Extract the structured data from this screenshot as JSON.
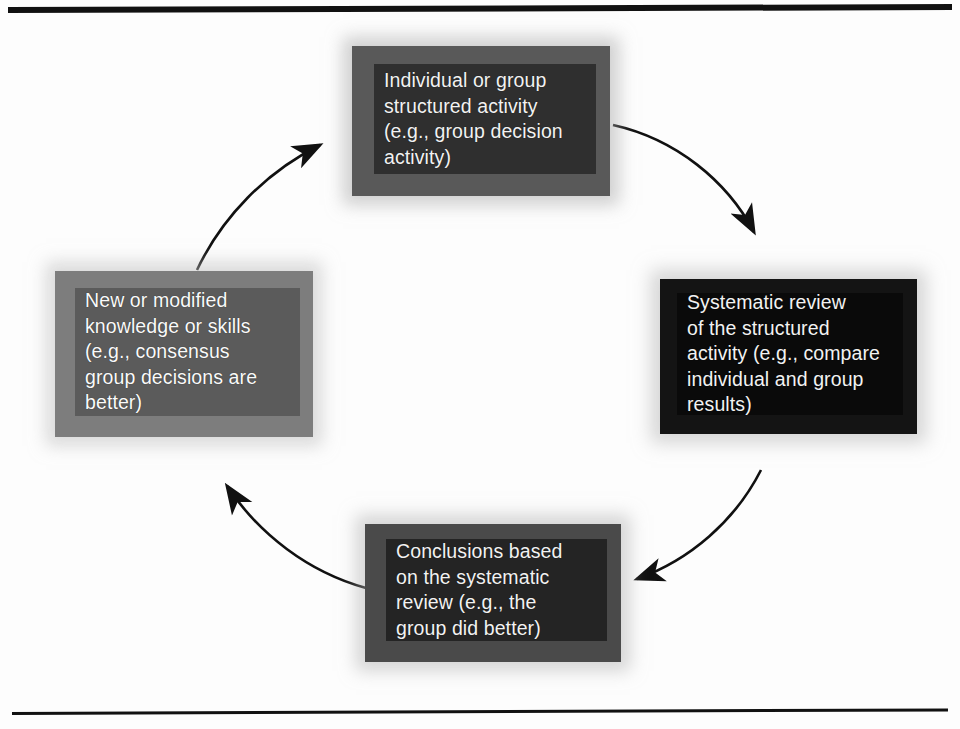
{
  "figure": {
    "layout": "circular-cycle",
    "direction": "clockwise",
    "background_color": "#fdfdfd",
    "line_color": "#111111",
    "text_color": "#f2f2f2"
  },
  "rules": {
    "top_label": "top-horizontal-rule",
    "bottom_label": "bottom-horizontal-rule"
  },
  "nodes": [
    {
      "id": "top",
      "position": "top",
      "text": "Individual or group\nstructured activity\n(e.g., group decision\nactivity)",
      "fill_color": "#2f2f2f",
      "border_color": "#595959"
    },
    {
      "id": "right",
      "position": "right",
      "text": "Systematic review\nof the structured\nactivity (e.g., compare\nindividual and group\nresults)",
      "fill_color": "#0a0a0a",
      "border_color": "#141414"
    },
    {
      "id": "bottom",
      "position": "bottom",
      "text": "Conclusions based\non the systematic\nreview (e.g., the\ngroup did better)",
      "fill_color": "#242424",
      "border_color": "#4a4a4a"
    },
    {
      "id": "left",
      "position": "left",
      "text": "New or modified\nknowledge or skills\n(e.g., consensus\ngroup decisions are\nbetter)",
      "fill_color": "#5b5b5b",
      "border_color": "#7d7d7d"
    }
  ],
  "arrows": [
    {
      "id": "top-to-right",
      "from": "top",
      "to": "right",
      "description": "curved arrow from top box to right box"
    },
    {
      "id": "right-to-bottom",
      "from": "right",
      "to": "bottom",
      "description": "curved arrow from right box to bottom box"
    },
    {
      "id": "bottom-to-left",
      "from": "bottom",
      "to": "left",
      "description": "curved arrow from bottom box to left box"
    },
    {
      "id": "left-to-top",
      "from": "left",
      "to": "top",
      "description": "curved arrow from left box to top box"
    }
  ]
}
